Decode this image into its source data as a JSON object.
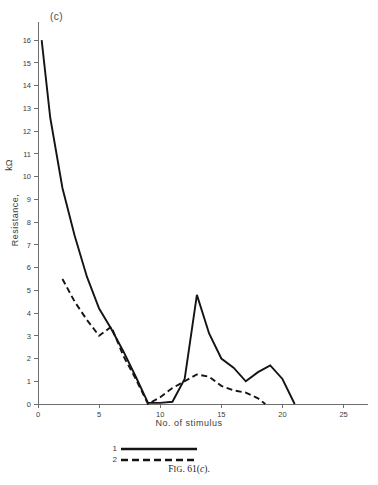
{
  "panel": {
    "label": "(c)"
  },
  "caption": {
    "prefix": "F",
    "smallcaps": "IG",
    "number": ". 61(",
    "italic": "c",
    "suffix": ")."
  },
  "legend": {
    "position": "below-axis",
    "entries": [
      {
        "key": "1",
        "style": "solid"
      },
      {
        "key": "2",
        "style": "dashed"
      }
    ]
  },
  "chart_data": {
    "type": "line",
    "title": "",
    "xlabel": "No. of stimulus",
    "ylabel": "Resistance,",
    "ylabel_unit": "kΩ",
    "grid": false,
    "xlim": [
      0,
      27
    ],
    "ylim": [
      0,
      16.8
    ],
    "xticks": [
      0,
      5,
      10,
      15,
      20,
      25
    ],
    "xtick_labels": [
      "0",
      "5",
      "10",
      "15",
      "20",
      "25"
    ],
    "yticks": [
      0,
      1,
      2,
      3,
      4,
      5,
      6,
      7,
      8,
      9,
      10,
      11,
      12,
      13,
      14,
      15,
      16
    ],
    "ytick_labels": [
      "0",
      "1",
      "2",
      "3",
      "4",
      "5",
      "6",
      "7",
      "8",
      "9",
      "10",
      "11",
      "12",
      "13",
      "14",
      "15",
      "16"
    ],
    "series": [
      {
        "name": "1",
        "style": "solid",
        "color": "#141414",
        "x": [
          0.3,
          1.0,
          2.0,
          3.0,
          4.0,
          5.0,
          6.0,
          7.0,
          8.0,
          9.0,
          10.0,
          11.0,
          12.0,
          13.0,
          14.0,
          15.0,
          16.0,
          17.0,
          18.0,
          19.0,
          20.0,
          21.0
        ],
        "y": [
          16.0,
          12.6,
          9.5,
          7.4,
          5.6,
          4.2,
          3.3,
          2.3,
          1.2,
          0.05,
          0.05,
          0.1,
          1.1,
          4.8,
          3.1,
          2.0,
          1.6,
          1.0,
          1.4,
          1.7,
          1.1,
          0.0
        ]
      },
      {
        "name": "2",
        "style": "dashed",
        "color": "#141414",
        "x": [
          2.0,
          3.0,
          4.0,
          5.0,
          6.0,
          7.0,
          8.0,
          9.0,
          10.0,
          11.0,
          12.0,
          13.0,
          14.0,
          15.0,
          16.0,
          17.0,
          18.0,
          18.6
        ],
        "y": [
          5.5,
          4.5,
          3.7,
          3.0,
          3.4,
          2.1,
          1.1,
          0.0,
          0.3,
          0.7,
          1.0,
          1.3,
          1.2,
          0.8,
          0.6,
          0.5,
          0.25,
          0.0
        ]
      }
    ]
  }
}
